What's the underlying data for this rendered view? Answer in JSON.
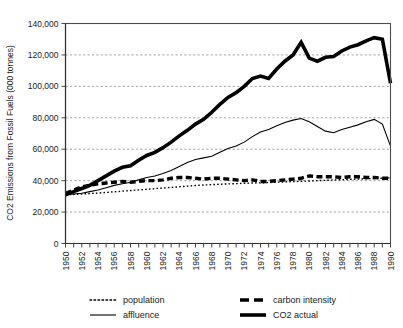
{
  "chart_data": {
    "type": "line",
    "title": "",
    "subtitle": "",
    "xlabel": "",
    "ylabel": "CO2 Emissions from Fossil Fuels (000 tonnes)",
    "xlim": [
      1950,
      1990
    ],
    "ylim": [
      0,
      140000
    ],
    "ytick_step": 20000,
    "xtick_step": 2,
    "xtick_minor_step": 1,
    "grid": true,
    "grid_axis": "y",
    "legend_position": "bottom",
    "ytick_labels": [
      "0",
      "20,000",
      "40,000",
      "60,000",
      "80,000",
      "100,000",
      "120,000",
      "140,000"
    ],
    "ytick_values": [
      0,
      20000,
      40000,
      60000,
      80000,
      100000,
      120000,
      140000
    ],
    "xtick_labels": [
      "1950",
      "1952",
      "1954",
      "1956",
      "1958",
      "1960",
      "1962",
      "1964",
      "1966",
      "1968",
      "1970",
      "1972",
      "1974",
      "1976",
      "1978",
      "1980",
      "1982",
      "1984",
      "1986",
      "1988",
      "1990"
    ],
    "xtick_values": [
      1950,
      1952,
      1954,
      1956,
      1958,
      1960,
      1962,
      1964,
      1966,
      1968,
      1970,
      1972,
      1974,
      1976,
      1978,
      1980,
      1982,
      1984,
      1986,
      1988,
      1990
    ],
    "x": [
      1950,
      1951,
      1952,
      1953,
      1954,
      1955,
      1956,
      1957,
      1958,
      1959,
      1960,
      1961,
      1962,
      1963,
      1964,
      1965,
      1966,
      1967,
      1968,
      1969,
      1970,
      1971,
      1972,
      1973,
      1974,
      1975,
      1976,
      1977,
      1978,
      1979,
      1980,
      1981,
      1982,
      1983,
      1984,
      1985,
      1986,
      1987,
      1988,
      1989,
      1990
    ],
    "series": [
      {
        "name": "population",
        "style": "dotted",
        "width": 1.4,
        "color": "#000000",
        "values": [
          31000,
          31200,
          31500,
          31800,
          32100,
          32500,
          32900,
          33300,
          33700,
          34100,
          34500,
          34900,
          35300,
          35700,
          36100,
          36500,
          36900,
          37200,
          37500,
          37700,
          37900,
          38100,
          38300,
          38500,
          38600,
          38800,
          39000,
          39200,
          39400,
          39600,
          39800,
          40000,
          40200,
          40400,
          40600,
          40800,
          41000,
          41200,
          41400,
          41600,
          41800
        ]
      },
      {
        "name": "affluence",
        "style": "solid",
        "width": 1.1,
        "color": "#000000",
        "values": [
          31000,
          31500,
          32000,
          33000,
          34000,
          35500,
          37000,
          38000,
          39000,
          40500,
          42000,
          43000,
          44500,
          46500,
          49000,
          51500,
          53500,
          54500,
          55500,
          58000,
          60500,
          62000,
          64500,
          68000,
          71000,
          72500,
          75000,
          77000,
          78500,
          79500,
          77500,
          74500,
          71500,
          70500,
          72500,
          74000,
          75500,
          77500,
          79000,
          76000,
          62000
        ]
      },
      {
        "name": "carbon intensity",
        "style": "dashed",
        "width": 3.4,
        "color": "#000000",
        "values": [
          32000,
          34000,
          36000,
          37000,
          38000,
          38500,
          39000,
          39500,
          39000,
          39500,
          40000,
          40000,
          40500,
          41500,
          42000,
          42000,
          41500,
          41000,
          41500,
          41500,
          41000,
          40500,
          40000,
          40500,
          39500,
          39500,
          40000,
          40500,
          41000,
          41500,
          43000,
          42500,
          42500,
          42500,
          42000,
          42500,
          42500,
          42000,
          42000,
          41500,
          41500
        ]
      },
      {
        "name": "CO2 actual",
        "style": "solid",
        "width": 3.6,
        "color": "#000000",
        "values": [
          31000,
          33000,
          35000,
          37000,
          40000,
          43000,
          46000,
          48500,
          49500,
          53000,
          56000,
          58000,
          61000,
          64500,
          68500,
          72000,
          76000,
          79000,
          83500,
          88500,
          93000,
          96000,
          100000,
          105000,
          106500,
          105000,
          111000,
          116000,
          120000,
          128000,
          118000,
          116000,
          118500,
          119000,
          122500,
          125000,
          126500,
          129000,
          131000,
          130000,
          102000
        ]
      }
    ],
    "legend": [
      {
        "label": "population",
        "style": "dotted"
      },
      {
        "label": "carbon intensity",
        "style": "dashed"
      },
      {
        "label": "affluence",
        "style": "solid-thin"
      },
      {
        "label": "CO2 actual",
        "style": "solid-thick"
      }
    ]
  }
}
